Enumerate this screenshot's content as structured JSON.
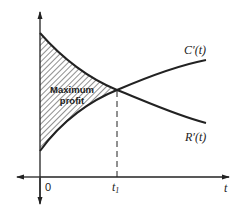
{
  "diagram": {
    "type": "economics-marginal-curves",
    "region_label_line1": "Maximum",
    "region_label_line2": "profit",
    "curves": {
      "cost": {
        "label": "C′(t)",
        "description": "increasing marginal cost curve"
      },
      "revenue": {
        "label": "R′(t)",
        "description": "decreasing marginal revenue curve"
      }
    },
    "axes": {
      "x_label": "t",
      "origin_label": "0",
      "t1_symbol": "t",
      "t1_subscript": "1"
    },
    "colors": {
      "line": "#222222",
      "hatch": "#333333",
      "background": "#ffffff"
    }
  }
}
